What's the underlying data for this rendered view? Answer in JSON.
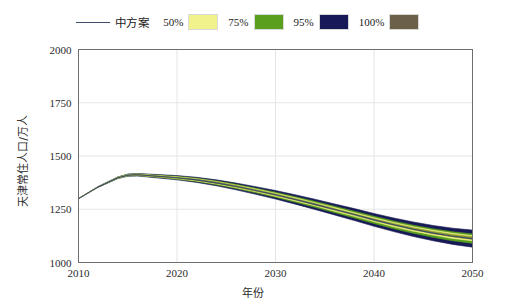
{
  "legend": {
    "line_entry": {
      "label": "中方案",
      "color": "#3c4a6b",
      "icon": "line-swatch"
    },
    "band_entries": [
      {
        "label": "50%",
        "color": "#f2f28c"
      },
      {
        "label": "75%",
        "color": "#5aa01e"
      },
      {
        "label": "95%",
        "color": "#171a56"
      },
      {
        "label": "100%",
        "color": "#6b6048"
      }
    ]
  },
  "chart_data": {
    "type": "area",
    "title": "",
    "xlabel": "年份",
    "ylabel": "天津常住人口/万人",
    "xlim": [
      2010,
      2050
    ],
    "ylim": [
      1000,
      2000
    ],
    "xticks": [
      2010,
      2020,
      2030,
      2040,
      2050
    ],
    "yticks": [
      1000,
      1250,
      1500,
      1750,
      2000
    ],
    "grid": true,
    "legend_position": "top-center",
    "x": [
      2010,
      2012,
      2014,
      2015,
      2016,
      2018,
      2020,
      2022,
      2024,
      2026,
      2028,
      2030,
      2032,
      2034,
      2036,
      2038,
      2040,
      2042,
      2044,
      2046,
      2048,
      2050
    ],
    "series": [
      {
        "name": "中方案",
        "color": "#3c4a6b",
        "values": [
          1300,
          1355,
          1398,
          1410,
          1412,
          1405,
          1398,
          1388,
          1374,
          1357,
          1338,
          1318,
          1296,
          1273,
          1249,
          1225,
          1200,
          1177,
          1156,
          1138,
          1123,
          1112
        ]
      }
    ],
    "bands": [
      {
        "name": "100%",
        "color": "#171a56",
        "lower": [
          1300,
          1353,
          1394,
          1405,
          1406,
          1397,
          1388,
          1376,
          1360,
          1341,
          1320,
          1298,
          1274,
          1249,
          1223,
          1197,
          1170,
          1145,
          1122,
          1102,
          1085,
          1072
        ],
        "upper": [
          1300,
          1357,
          1402,
          1415,
          1418,
          1413,
          1408,
          1400,
          1388,
          1373,
          1356,
          1338,
          1318,
          1297,
          1275,
          1253,
          1230,
          1209,
          1190,
          1174,
          1161,
          1152
        ]
      },
      {
        "name": "95%",
        "color": "#5aa01e",
        "lower": [
          1300,
          1354,
          1395,
          1406,
          1408,
          1400,
          1391,
          1380,
          1365,
          1347,
          1327,
          1306,
          1283,
          1259,
          1234,
          1209,
          1183,
          1159,
          1137,
          1118,
          1102,
          1090
        ],
        "upper": [
          1300,
          1356,
          1401,
          1414,
          1416,
          1410,
          1405,
          1396,
          1383,
          1367,
          1349,
          1330,
          1309,
          1287,
          1264,
          1241,
          1217,
          1195,
          1175,
          1158,
          1144,
          1134
        ]
      },
      {
        "name": "75%",
        "color": "#f2f28c",
        "lower": [
          1300,
          1354,
          1396,
          1408,
          1409,
          1402,
          1394,
          1383,
          1369,
          1351,
          1332,
          1311,
          1289,
          1266,
          1241,
          1217,
          1192,
          1168,
          1147,
          1129,
          1113,
          1102
        ],
        "upper": [
          1300,
          1356,
          1400,
          1412,
          1415,
          1408,
          1402,
          1393,
          1380,
          1363,
          1345,
          1325,
          1304,
          1281,
          1258,
          1234,
          1210,
          1188,
          1168,
          1151,
          1137,
          1126
        ]
      },
      {
        "name": "50%",
        "color": "#8a9a2a",
        "lower": [
          1300,
          1355,
          1397,
          1409,
          1410,
          1403,
          1396,
          1385,
          1371,
          1354,
          1335,
          1315,
          1293,
          1270,
          1246,
          1222,
          1197,
          1174,
          1153,
          1135,
          1120,
          1108
        ],
        "upper": [
          1300,
          1355,
          1399,
          1411,
          1414,
          1407,
          1400,
          1391,
          1378,
          1361,
          1342,
          1322,
          1300,
          1277,
          1253,
          1229,
          1205,
          1183,
          1163,
          1146,
          1132,
          1121
        ]
      }
    ]
  }
}
